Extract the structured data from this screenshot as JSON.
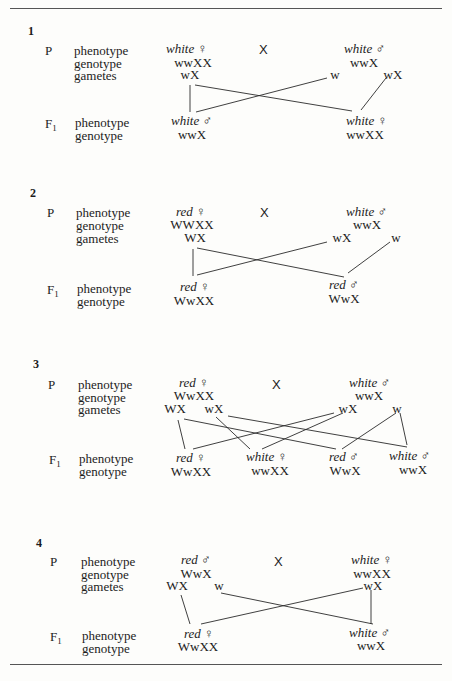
{
  "labels": {
    "P": "P",
    "F1_main": "F",
    "F1_sub": "1",
    "phenotype": "phenotype",
    "genotype": "genotype",
    "gametes": "gametes",
    "cross": "X",
    "female": "♀",
    "male": "♂"
  },
  "crosses": [
    {
      "number": "1",
      "parents": [
        {
          "phenotype": "white",
          "sex": "♀",
          "genotype": "wwXX"
        },
        {
          "phenotype": "white",
          "sex": "♂",
          "genotype": "wwX"
        }
      ],
      "gametes": [
        {
          "parent": 0,
          "allele": "wX"
        },
        {
          "parent": 1,
          "allele": "w"
        },
        {
          "parent": 1,
          "allele": "wX"
        }
      ],
      "offspring": [
        {
          "phenotype": "white",
          "sex": "♂",
          "genotype": "wwX"
        },
        {
          "phenotype": "white",
          "sex": "♀",
          "genotype": "wwXX"
        }
      ]
    },
    {
      "number": "2",
      "parents": [
        {
          "phenotype": "red",
          "sex": "♀",
          "genotype": "WWXX"
        },
        {
          "phenotype": "white",
          "sex": "♂",
          "genotype": "wwX"
        }
      ],
      "gametes": [
        {
          "parent": 0,
          "allele": "WX"
        },
        {
          "parent": 1,
          "allele": "wX"
        },
        {
          "parent": 1,
          "allele": "w"
        }
      ],
      "offspring": [
        {
          "phenotype": "red",
          "sex": "♀",
          "genotype": "WwXX"
        },
        {
          "phenotype": "red",
          "sex": "♂",
          "genotype": "WwX"
        }
      ]
    },
    {
      "number": "3",
      "parents": [
        {
          "phenotype": "red",
          "sex": "♀",
          "genotype": "WwXX"
        },
        {
          "phenotype": "white",
          "sex": "♂",
          "genotype": "wwX"
        }
      ],
      "gametes": [
        {
          "parent": 0,
          "allele": "WX"
        },
        {
          "parent": 0,
          "allele": "wX"
        },
        {
          "parent": 1,
          "allele": "wX"
        },
        {
          "parent": 1,
          "allele": "w"
        }
      ],
      "offspring": [
        {
          "phenotype": "red",
          "sex": "♀",
          "genotype": "WwXX"
        },
        {
          "phenotype": "white",
          "sex": "♀",
          "genotype": "wwXX"
        },
        {
          "phenotype": "red",
          "sex": "♂",
          "genotype": "WwX"
        },
        {
          "phenotype": "white",
          "sex": "♂",
          "genotype": "wwX"
        }
      ]
    },
    {
      "number": "4",
      "parents": [
        {
          "phenotype": "red",
          "sex": "♂",
          "genotype": "WwX"
        },
        {
          "phenotype": "white",
          "sex": "♀",
          "genotype": "wwXX"
        }
      ],
      "gametes": [
        {
          "parent": 0,
          "allele": "WX"
        },
        {
          "parent": 0,
          "allele": "w"
        },
        {
          "parent": 1,
          "allele": "wX"
        }
      ],
      "offspring": [
        {
          "phenotype": "red",
          "sex": "♀",
          "genotype": "WwXX"
        },
        {
          "phenotype": "white",
          "sex": "♂",
          "genotype": "wwX"
        }
      ]
    }
  ]
}
